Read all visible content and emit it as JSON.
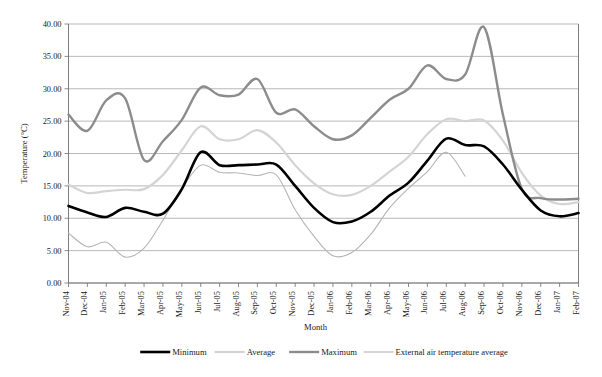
{
  "chart_data": {
    "type": "line",
    "title": "",
    "xlabel": "Month",
    "ylabel": "Temperature (°C)",
    "ylim": [
      0,
      40
    ],
    "ytick_step": 5,
    "ytick_labels": [
      "0.00",
      "5.00",
      "10.00",
      "15.00",
      "20.00",
      "25.00",
      "30.00",
      "35.00",
      "40.00"
    ],
    "grid": true,
    "legend_position": "bottom",
    "categories": [
      "Nov-04",
      "Dec-04",
      "Jan-05",
      "Feb-05",
      "Mar-05",
      "Apr-05",
      "May-05",
      "Jun-05",
      "Jul-05",
      "Aug-05",
      "Sep-05",
      "Oct-05",
      "Nov-05",
      "Dec-05",
      "Jan-06",
      "Feb-06",
      "Mar-06",
      "Apr-06",
      "May-06",
      "Jun-06",
      "Jul-06",
      "Aug-06",
      "Sep-06",
      "Oct-06",
      "Nov-06",
      "Dec-06",
      "Jan-07",
      "Feb-07"
    ],
    "series": [
      {
        "name": "Minimum",
        "color": "#000000",
        "width": 2.6,
        "values": [
          11.9,
          10.9,
          10.2,
          11.6,
          11.0,
          10.7,
          14.5,
          20.2,
          18.2,
          18.2,
          18.3,
          18.3,
          15.0,
          11.6,
          9.4,
          9.5,
          11.0,
          13.5,
          15.5,
          18.9,
          22.3,
          21.3,
          21.1,
          18.3,
          14.4,
          11.2,
          10.3,
          10.8
        ]
      },
      {
        "name": "Average",
        "color": "#d4d4d4",
        "width": 2.2,
        "values": [
          15.2,
          13.9,
          14.2,
          14.4,
          14.5,
          16.7,
          20.5,
          24.2,
          22.2,
          22.2,
          23.6,
          21.7,
          18.2,
          15.4,
          13.7,
          13.6,
          15.0,
          17.2,
          19.5,
          23.0,
          25.3,
          25.0,
          25.1,
          22.0,
          17.0,
          13.5,
          12.2,
          12.5
        ]
      },
      {
        "name": "Maximum",
        "color": "#8c8c8c",
        "width": 2.4,
        "values": [
          26.0,
          23.5,
          28.2,
          28.5,
          19.0,
          21.9,
          25.2,
          30.2,
          29.0,
          29.1,
          31.5,
          26.3,
          26.8,
          24.2,
          22.2,
          22.8,
          25.5,
          28.3,
          30.0,
          33.6,
          31.5,
          32.2,
          39.5,
          26.0,
          14.5,
          13.1,
          12.9,
          13.0
        ]
      },
      {
        "name": "External air temperature average",
        "color": "#b5b5b5",
        "width": 1.1,
        "values": [
          7.7,
          5.6,
          6.3,
          4.0,
          5.4,
          9.7,
          14.6,
          18.2,
          17.1,
          17.0,
          16.6,
          16.7,
          11.3,
          7.2,
          4.2,
          4.7,
          7.5,
          11.6,
          14.6,
          17.2,
          20.2,
          16.5,
          null,
          null,
          null,
          null,
          null,
          null
        ]
      }
    ]
  },
  "legend": {
    "items": [
      {
        "label": "Minimum"
      },
      {
        "label": "Average"
      },
      {
        "label": "Maximum"
      },
      {
        "label": "External air temperature average"
      }
    ]
  }
}
